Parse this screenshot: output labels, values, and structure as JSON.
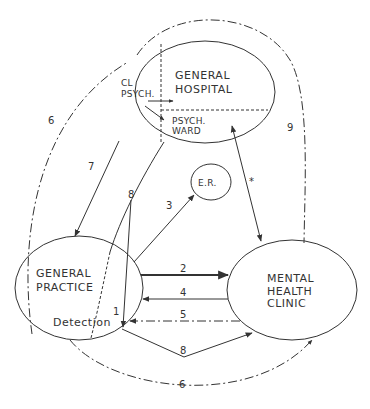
{
  "nodes": {
    "general_hospital": {
      "line1": "GENERAL",
      "line2": "HOSPITAL"
    },
    "cl_psych": {
      "line1": "CL",
      "line2": "PSYCH."
    },
    "psych_ward": {
      "line1": "PSYCH.",
      "line2": "WARD"
    },
    "er": {
      "label": "E.R."
    },
    "general_practice": {
      "line1": "GENERAL",
      "line2": "PRACTICE",
      "sub": "Detection"
    },
    "mental_health_clinic": {
      "line1": "MENTAL",
      "line2": "HEALTH",
      "line3": "CLINIC"
    }
  },
  "edges": {
    "e1": "1",
    "e2": "2",
    "e3": "3",
    "e4": "4",
    "e5": "5",
    "e6_top": "6",
    "e6_bottom": "6",
    "e7": "7",
    "e8_top": "8",
    "e8_bottom": "8",
    "e9": "9",
    "star": "*"
  },
  "colors": {
    "stroke": "#333333",
    "background": "#ffffff"
  }
}
